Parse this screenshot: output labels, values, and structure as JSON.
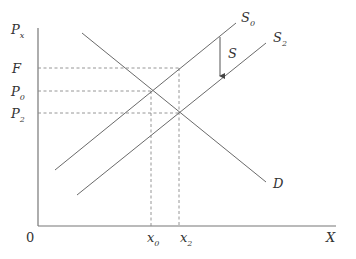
{
  "diagram": {
    "type": "supply-demand",
    "axes": {
      "y_label": "P",
      "y_label_sub": "x",
      "x_label": "X",
      "origin_label": "0"
    },
    "price_levels": [
      {
        "label": "F",
        "sub": ""
      },
      {
        "label": "P",
        "sub": "0"
      },
      {
        "label": "P",
        "sub": "2"
      }
    ],
    "quantity_levels": [
      {
        "label": "x",
        "sub": "0"
      },
      {
        "label": "x",
        "sub": "2"
      }
    ],
    "curves": {
      "demand": {
        "label": "D"
      },
      "supply_initial": {
        "label": "S",
        "sub": "0"
      },
      "supply_shifted": {
        "label": "S",
        "sub": "2"
      }
    },
    "shift_arrow": {
      "label": "S",
      "direction": "down"
    },
    "colors": {
      "line": "#6a6a6a",
      "text": "#333333",
      "background": "#ffffff"
    }
  }
}
